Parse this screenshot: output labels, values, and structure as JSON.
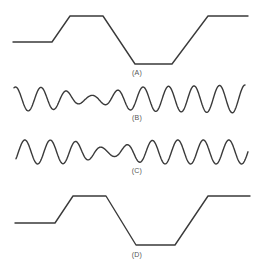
{
  "figure": {
    "panels": [
      {
        "id": "A",
        "label": "(A)",
        "type": "trapezoid-pulse",
        "label_pos": {
          "x": 137,
          "y": 73
        }
      },
      {
        "id": "B",
        "label": "(B)",
        "type": "amplitude-modulated-sine",
        "label_pos": {
          "x": 137,
          "y": 116
        }
      },
      {
        "id": "C",
        "label": "(C)",
        "type": "amplitude-modulated-sine",
        "label_pos": {
          "x": 137,
          "y": 170
        }
      },
      {
        "id": "D",
        "label": "(D)",
        "type": "trapezoid-pulse",
        "label_pos": {
          "x": 137,
          "y": 251
        }
      }
    ],
    "stroke_color": "#3a3a3a"
  }
}
